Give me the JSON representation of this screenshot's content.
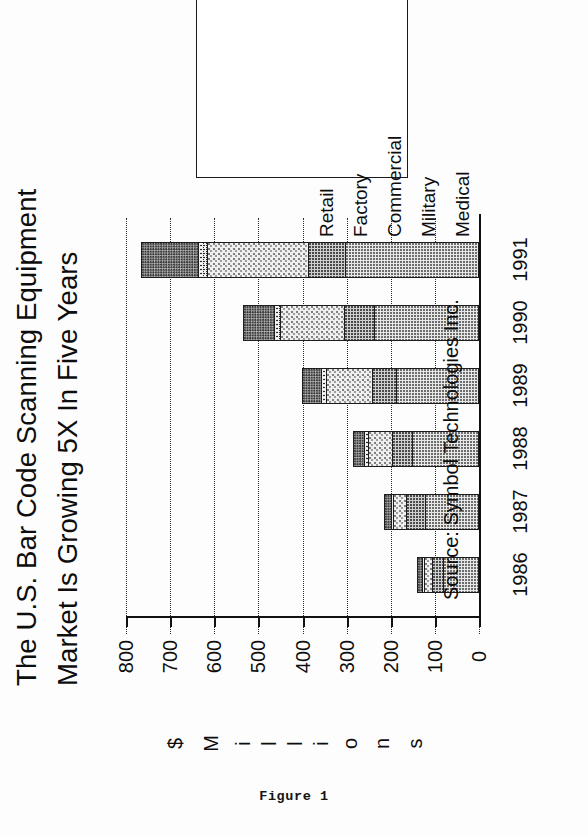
{
  "title": {
    "line1": "The U.S. Bar Code Scanning Equipment",
    "line2": "Market Is Growing 5X In Five Years"
  },
  "caption": "Figure 1",
  "source": "Source: Symbol Technologies Inc.",
  "axis_title_letters": [
    "$",
    "M",
    "i",
    "l",
    "l",
    "i",
    "o",
    "n",
    "s"
  ],
  "axis_title": "$ Millions",
  "legend": {
    "items": [
      {
        "label": "Retail",
        "swatch": "pat-retail"
      },
      {
        "label": "Factory",
        "swatch": "pat-factory"
      },
      {
        "label": "Commercial",
        "swatch": "pat-commercial"
      },
      {
        "label": "Military",
        "swatch": "pat-military"
      },
      {
        "label": "Medical",
        "swatch": "pat-medical"
      }
    ]
  },
  "chart_data": {
    "type": "bar",
    "orientation": "horizontal",
    "title": "The U.S. Bar Code Scanning Equipment Market Is Growing 5X In Five Years",
    "xlabel": "$ Millions",
    "ylabel": "",
    "xlim": [
      0,
      800
    ],
    "xticks": [
      800,
      700,
      600,
      500,
      400,
      300,
      200,
      100,
      0
    ],
    "grid": true,
    "legend_position": "top-right",
    "categories": [
      "1986",
      "1987",
      "1988",
      "1989",
      "1990",
      "1991"
    ],
    "series": [
      {
        "name": "Retail",
        "swatch": "pat-retail",
        "values": [
          80,
          120,
          150,
          185,
          235,
          300
        ]
      },
      {
        "name": "Factory",
        "swatch": "pat-factory",
        "values": [
          25,
          45,
          45,
          55,
          70,
          85
        ]
      },
      {
        "name": "Commercial",
        "swatch": "pat-commercial",
        "values": [
          20,
          30,
          55,
          105,
          145,
          230
        ]
      },
      {
        "name": "Military",
        "swatch": "pat-military",
        "values": [
          5,
          5,
          10,
          12,
          15,
          20
        ]
      },
      {
        "name": "Medical",
        "swatch": "pat-medical",
        "values": [
          10,
          15,
          25,
          45,
          70,
          130
        ]
      }
    ],
    "totals": [
      140,
      215,
      285,
      402,
      535,
      765
    ]
  }
}
